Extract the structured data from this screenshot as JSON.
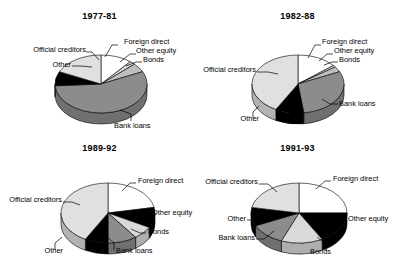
{
  "figure": {
    "background": "#ffffff",
    "panel_count": 4
  },
  "legend_fills": {
    "Foreign direct": "#ffffff",
    "Other equity": "#d9d9d9",
    "Bonds": "#bfbfbf",
    "Bank loans": "#8c8c8c",
    "Other": "#000000",
    "Official creditors": "#e0e0e0"
  },
  "chart_data": [
    {
      "type": "pie",
      "title": "1977-81",
      "categories": [
        "Foreign direct",
        "Other equity",
        "Bonds",
        "Bank loans",
        "Other",
        "Official creditors"
      ],
      "values": [
        11,
        2,
        5,
        56,
        8,
        18
      ],
      "colors": [
        "#ffffff",
        "#d9d9d9",
        "#bfbfbf",
        "#8c8c8c",
        "#000000",
        "#e0e0e0"
      ],
      "labels": [
        "Foreign direct",
        "Other equity",
        "Bonds",
        "Bank loans",
        "Other",
        "Official creditors"
      ],
      "xlabel": "",
      "ylabel": "",
      "grid": false,
      "legend": "callout-labels"
    },
    {
      "type": "pie",
      "title": "1982-88",
      "categories": [
        "Foreign direct",
        "Other equity",
        "Bonds",
        "Bank loans",
        "Other",
        "Official creditors"
      ],
      "values": [
        14,
        1,
        3,
        30,
        10,
        42
      ],
      "colors": [
        "#ffffff",
        "#d9d9d9",
        "#bfbfbf",
        "#8c8c8c",
        "#000000",
        "#e0e0e0"
      ],
      "labels": [
        "Foreign direct",
        "Other equity",
        "Bonds",
        "Bank loans",
        "Other",
        "Official creditors"
      ],
      "xlabel": "",
      "ylabel": "",
      "grid": false,
      "legend": "callout-labels"
    },
    {
      "type": "pie",
      "title": "1989-92",
      "categories": [
        "Foreign direct",
        "Other equity",
        "Bonds",
        "Bank loans",
        "Other",
        "Official creditors"
      ],
      "values": [
        22,
        11,
        7,
        10,
        8,
        42
      ],
      "colors": [
        "#ffffff",
        "#000000",
        "#d9d9d9",
        "#8c8c8c",
        "#000000",
        "#e0e0e0"
      ],
      "labels": [
        "Foreign direct",
        "Other equity",
        "Bonds",
        "Bank loans",
        "Other",
        "Official creditors"
      ],
      "xlabel": "",
      "ylabel": "",
      "grid": false,
      "legend": "callout-labels"
    },
    {
      "type": "pie",
      "title": "1991-93",
      "categories": [
        "Foreign direct",
        "Other equity",
        "Bonds",
        "Bank loans",
        "Other",
        "Official creditors"
      ],
      "values": [
        25,
        17,
        14,
        12,
        10,
        22
      ],
      "colors": [
        "#ffffff",
        "#000000",
        "#d9d9d9",
        "#8c8c8c",
        "#000000",
        "#e0e0e0"
      ],
      "labels": [
        "Foreign direct",
        "Other equity",
        "Bonds",
        "Bank loans",
        "Other",
        "Official creditors"
      ],
      "xlabel": "",
      "ylabel": "",
      "grid": false,
      "legend": "callout-labels"
    }
  ],
  "panels": [
    {
      "title": "1977-81",
      "labels": {
        "foreign_direct": "Foreign direct",
        "other_equity": "Other equity",
        "bonds": "Bonds",
        "bank_loans": "Bank loans",
        "other": "Other",
        "official_creditors": "Official creditors"
      }
    },
    {
      "title": "1982-88",
      "labels": {
        "foreign_direct": "Foreign direct",
        "other_equity": "Other equity",
        "bonds": "Bonds",
        "bank_loans": "Bank loans",
        "other": "Other",
        "official_creditors": "Official creditors"
      }
    },
    {
      "title": "1989-92",
      "labels": {
        "foreign_direct": "Foreign direct",
        "other_equity": "Other equity",
        "bonds": "Bonds",
        "bank_loans": "Bank loans",
        "other": "Other",
        "official_creditors": "Official creditors"
      }
    },
    {
      "title": "1991-93",
      "labels": {
        "foreign_direct": "Foreign direct",
        "other_equity": "Other equity",
        "bonds": "Bonds",
        "bank_loans": "Bank loans",
        "other": "Other",
        "official_creditors": "Official creditors"
      }
    }
  ]
}
